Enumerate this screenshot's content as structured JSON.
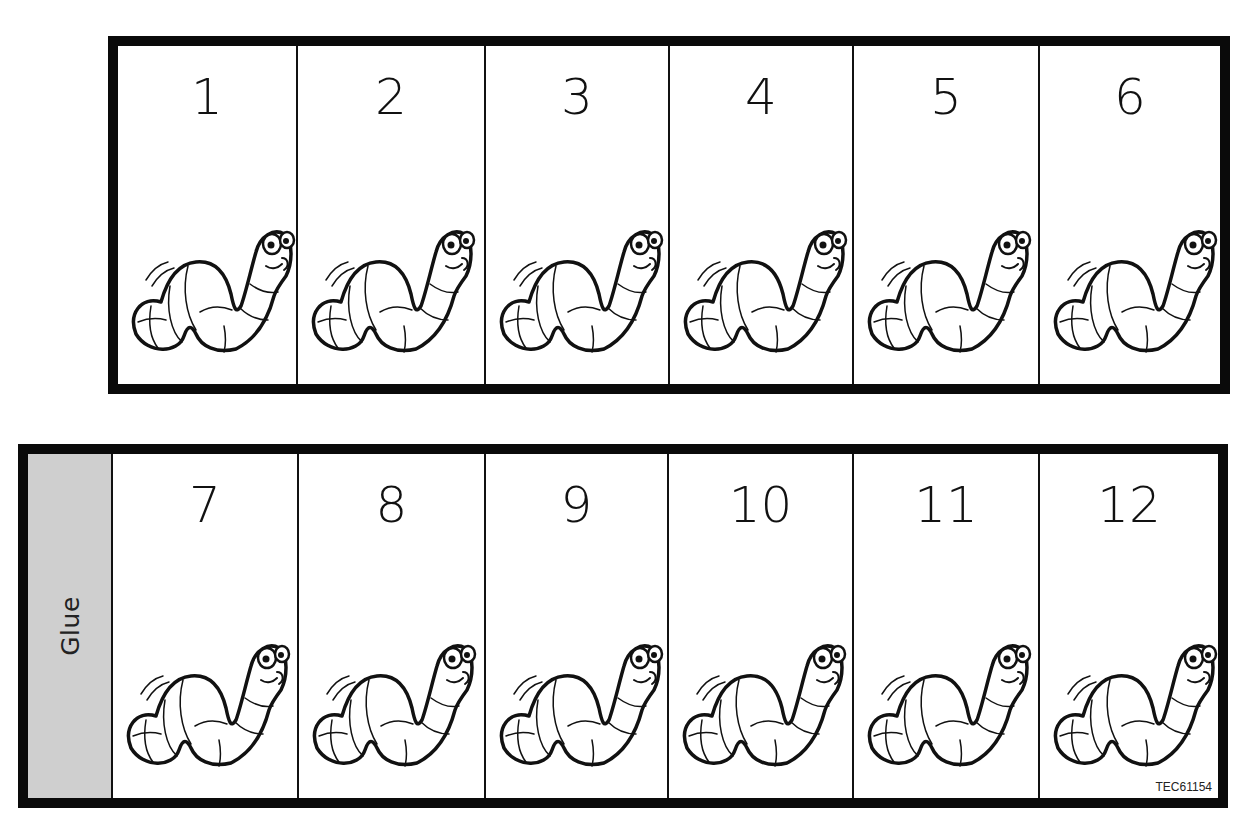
{
  "top_strip": {
    "cells": [
      {
        "number": "1"
      },
      {
        "number": "2"
      },
      {
        "number": "3"
      },
      {
        "number": "4"
      },
      {
        "number": "5"
      },
      {
        "number": "6"
      }
    ]
  },
  "bottom_strip": {
    "glue_label": "Glue",
    "cells": [
      {
        "number": "7"
      },
      {
        "number": "8"
      },
      {
        "number": "9"
      },
      {
        "number": "10"
      },
      {
        "number": "11"
      },
      {
        "number": "12"
      }
    ],
    "code": "TEC61154"
  },
  "icons": {
    "cell_icon": "worm-icon"
  },
  "colors": {
    "border": "#0a0a0a",
    "glue_bg": "#cfcfcf",
    "page_bg": "#ffffff"
  }
}
